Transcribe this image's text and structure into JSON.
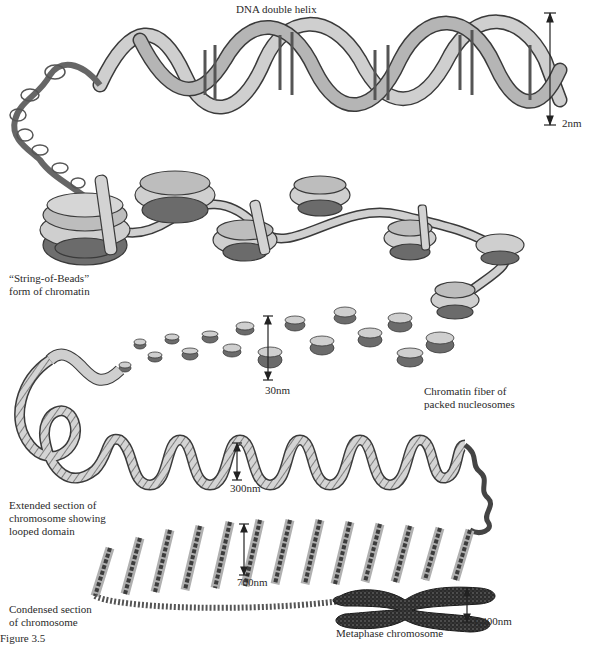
{
  "figure": {
    "labels": {
      "dna_helix": "DNA double helix",
      "string_of_beads_line1": "“String-of-Beads”",
      "string_of_beads_line2": "form of chromatin",
      "chromatin_fiber_line1": "Chromatin fiber of",
      "chromatin_fiber_line2": "packed nucleosomes",
      "extended_line1": "Extended section of",
      "extended_line2": "chromosome showing",
      "extended_line3": "looped domain",
      "condensed_line1": "Condensed section",
      "condensed_line2": "of chromosome",
      "metaphase": "Metaphase chromosome",
      "figure_caption": "Figure 3.5"
    },
    "scale_bars": {
      "dna": "2nm",
      "fiber": "30nm",
      "extended": "300nm",
      "condensed": "700nm",
      "metaphase": "1,400nm"
    },
    "colors": {
      "ribbon_fill": "#c9c9c9",
      "ribbon_dark": "#9a9a9a",
      "histone_core": "#6e6e6e",
      "outline": "#3a3a3a",
      "chromosome": "#2b2b2b"
    }
  }
}
